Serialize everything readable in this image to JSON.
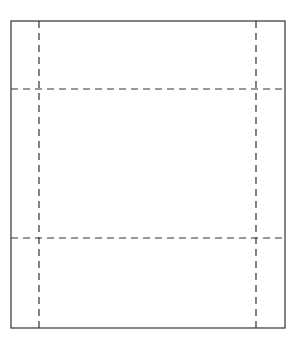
{
  "diagram": {
    "type": "box-net-fold-lines",
    "canvas": {
      "width": 299,
      "height": 348
    },
    "outline": {
      "x": 11,
      "y": 21,
      "width": 274,
      "height": 307,
      "stroke": "#333333"
    },
    "fold_lines": {
      "vertical": [
        39,
        256
      ],
      "horizontal": [
        89,
        238
      ],
      "dash": "7,5",
      "stroke": "#333333"
    }
  }
}
